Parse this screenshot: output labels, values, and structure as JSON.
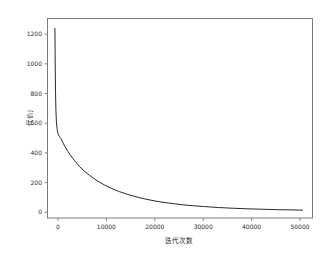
{
  "chart_data": {
    "type": "line",
    "title": "",
    "xlabel": "迭代次数",
    "ylabel": "代价J",
    "xlim": [
      -1500,
      52000
    ],
    "ylim": [
      -40,
      1330
    ],
    "grid": false,
    "legend": null,
    "xticks": [
      0,
      10000,
      20000,
      30000,
      40000,
      50000
    ],
    "xtick_labels": [
      "0",
      "10000",
      "20000",
      "30000",
      "40000",
      "50000"
    ],
    "yticks": [
      0,
      200,
      400,
      600,
      800,
      1000,
      1200
    ],
    "ytick_labels": [
      "0",
      "200",
      "400",
      "600",
      "800",
      "1000",
      "1200"
    ],
    "series": [
      {
        "name": "代价J",
        "color": "#2a2a2a",
        "x": [
          0,
          60,
          120,
          200,
          300,
          420,
          560,
          700,
          900,
          1200,
          1600,
          2000,
          2600,
          3200,
          4000,
          5000,
          6000,
          7000,
          8000,
          9000,
          10000,
          11500,
          13000,
          14500,
          16000,
          18000,
          20000,
          22000,
          24000,
          26000,
          28000,
          30000,
          33000,
          36000,
          39000,
          42000,
          45000,
          47500,
          50000
        ],
        "y": [
          1262,
          1010,
          830,
          700,
          620,
          575,
          548,
          532,
          520,
          505,
          478,
          452,
          418,
          388,
          352,
          312,
          280,
          252,
          228,
          206,
          187,
          162,
          141,
          124,
          109,
          92,
          78,
          67,
          58,
          50,
          44,
          39,
          32,
          27,
          23,
          20,
          17,
          16,
          14
        ]
      }
    ],
    "annotations": []
  },
  "figure": {
    "background_color": "#ffffff",
    "frame_color": "#6e6e6e",
    "text_color": "#2b2b2b"
  }
}
